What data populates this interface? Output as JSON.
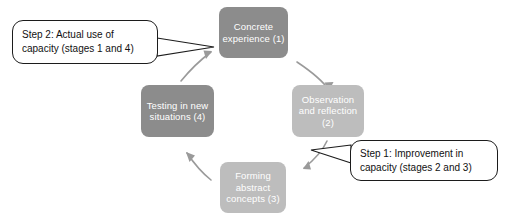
{
  "diagram": {
    "background_color": "#ffffff",
    "nodes": [
      {
        "id": "concrete-experience",
        "label": "Concrete\nexperience\n(1)",
        "stage": 1,
        "color": "#8c8c8c",
        "text_color": "#ffffff",
        "x": 219,
        "y": 7,
        "w": 69,
        "h": 51
      },
      {
        "id": "observation-and-reflection",
        "label": "Observation\nand reflection\n(2)",
        "stage": 2,
        "color": "#bdbdbd",
        "text_color": "#ffffff",
        "x": 292,
        "y": 85,
        "w": 72,
        "h": 52
      },
      {
        "id": "forming-abstract-concepts",
        "label": "Forming\nabstract\nconcepts (3)",
        "stage": 3,
        "color": "#bdbdbd",
        "text_color": "#ffffff",
        "x": 220,
        "y": 162,
        "w": 66,
        "h": 51
      },
      {
        "id": "testing-in-new-situations",
        "label": "Testing in\nnew\nsituations (4)",
        "stage": 4,
        "color": "#8c8c8c",
        "text_color": "#ffffff",
        "x": 141,
        "y": 85,
        "w": 73,
        "h": 52
      }
    ],
    "callouts": [
      {
        "id": "step-2",
        "text": "Step 2: Actual use of\ncapacity (stages 1 and 4)",
        "x": 12,
        "y": 20,
        "w": 146,
        "h": 44,
        "points_to": "concrete-experience"
      },
      {
        "id": "step-1",
        "text": "Step 1: Improvement in\ncapacity (stages 2 and 3)",
        "x": 350,
        "y": 140,
        "w": 148,
        "h": 41,
        "points_to": "forming-abstract-concepts"
      }
    ],
    "cycle_arrows": [
      {
        "id": "arrow-1-to-2",
        "from": "concrete-experience",
        "to": "observation-and-reflection",
        "color": "#9a9a9a"
      },
      {
        "id": "arrow-2-to-3",
        "from": "observation-and-reflection",
        "to": "forming-abstract-concepts",
        "color": "#9a9a9a"
      },
      {
        "id": "arrow-3-to-4",
        "from": "forming-abstract-concepts",
        "to": "testing-in-new-situations",
        "color": "#9a9a9a"
      },
      {
        "id": "arrow-4-to-1",
        "from": "testing-in-new-situations",
        "to": "concrete-experience",
        "color": "#9a9a9a"
      }
    ]
  }
}
